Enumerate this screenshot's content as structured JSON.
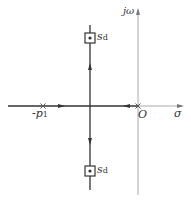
{
  "diagram": {
    "type": "root-locus",
    "axes": {
      "imag_label": "jω",
      "real_label": "σ",
      "origin_label": "O"
    },
    "poles": [
      {
        "label": "-p",
        "subscript": "1"
      }
    ],
    "points": [
      {
        "label": "s",
        "subscript": "d",
        "position": "upper"
      },
      {
        "label": "s",
        "subscript": "d",
        "position": "lower"
      }
    ],
    "colors": {
      "locus": "#333333",
      "axis": "#999999"
    }
  }
}
